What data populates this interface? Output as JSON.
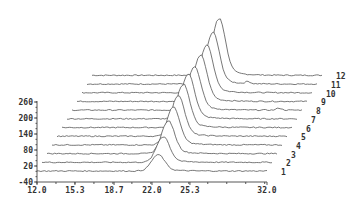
{
  "chart_data": {
    "type": "line",
    "subtype": "3d-waterfall",
    "title": "",
    "xlabel": "",
    "ylabel": "",
    "x_ticks": [
      "12.0",
      "15.3",
      "18.7",
      "22.0",
      "25.3",
      "32.0"
    ],
    "x_tick_values": [
      12.0,
      15.3,
      18.7,
      22.0,
      25.3,
      32.0
    ],
    "y_ticks": [
      "260",
      "200",
      "140",
      "80",
      "20",
      "-40"
    ],
    "y_tick_values": [
      260,
      200,
      140,
      80,
      20,
      -40
    ],
    "xlim": [
      12.0,
      32.0
    ],
    "ylim": [
      -40,
      260
    ],
    "grid": false,
    "legend": "none",
    "series_labels": [
      "1",
      "2",
      "3",
      "4",
      "5",
      "6",
      "7",
      "8",
      "9",
      "10",
      "11",
      "12"
    ],
    "series": [
      {
        "name": "1",
        "peak_x": 22.5,
        "peak_height": 60,
        "baseline": 0
      },
      {
        "name": "2",
        "peak_x": 22.5,
        "peak_height": 95,
        "baseline": 0
      },
      {
        "name": "3",
        "peak_x": 22.5,
        "peak_height": 120,
        "baseline": 0
      },
      {
        "name": "4",
        "peak_x": 22.5,
        "peak_height": 140,
        "baseline": 0
      },
      {
        "name": "5",
        "peak_x": 22.5,
        "peak_height": 150,
        "baseline": 0
      },
      {
        "name": "6",
        "peak_x": 22.5,
        "peak_height": 160,
        "baseline": 0
      },
      {
        "name": "7",
        "peak_x": 22.5,
        "peak_height": 165,
        "baseline": 0
      },
      {
        "name": "8",
        "peak_x": 22.6,
        "peak_height": 160,
        "baseline": 0,
        "minor_peak_x": 30.0,
        "minor_peak_height": 8
      },
      {
        "name": "9",
        "peak_x": 22.7,
        "peak_height": 170,
        "baseline": 0
      },
      {
        "name": "10",
        "peak_x": 22.8,
        "peak_height": 175,
        "baseline": 0
      },
      {
        "name": "11",
        "peak_x": 22.9,
        "peak_height": 190,
        "baseline": 0,
        "minor_peak_x": 26.0,
        "minor_peak_height": 8
      },
      {
        "name": "12",
        "peak_x": 23.0,
        "peak_height": 210,
        "baseline": 0
      }
    ]
  },
  "layout": {
    "origin_x": 37,
    "origin_y": 171,
    "x_axis_px_width": 230,
    "y_px_per_unit": 0.267,
    "depth_dx": 5,
    "depth_dy": -8.7,
    "peak_sigma": 0.55
  }
}
